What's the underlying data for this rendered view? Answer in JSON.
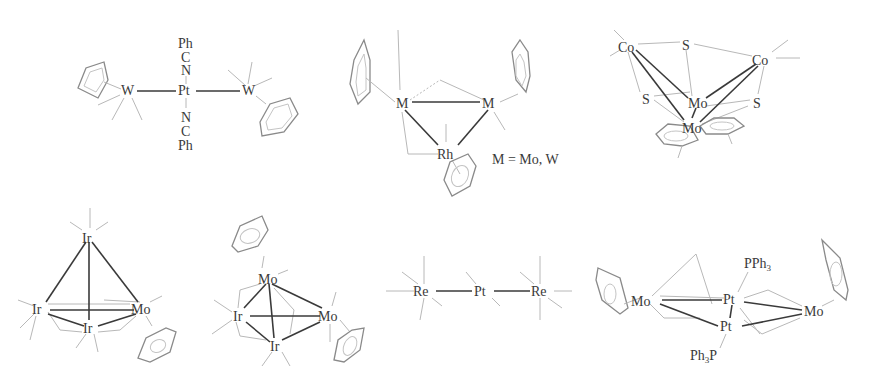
{
  "figure": {
    "colors": {
      "bond": "#3a3a3a",
      "ligand_line": "#b8b8b8",
      "ring": "#8a8a8a",
      "background": "#ffffff"
    },
    "structures": [
      {
        "id": "s1",
        "atoms": {
          "w_left": "W",
          "pt": "Pt",
          "w_right": "W",
          "ph_top": "Ph",
          "c_top": "C",
          "n_top": "N",
          "n_bottom": "N",
          "c_bottom": "C",
          "ph_bottom": "Ph"
        }
      },
      {
        "id": "s2",
        "atoms": {
          "m_left": "M",
          "m_right": "M",
          "rh": "Rh"
        },
        "legend": "M = Mo, W"
      },
      {
        "id": "s3",
        "atoms": {
          "co_left": "Co",
          "s_top": "S",
          "co_right": "Co",
          "mo_upper": "Mo",
          "s_left": "S",
          "s_right": "S",
          "mo_lower": "Mo"
        }
      },
      {
        "id": "s4",
        "atoms": {
          "ir_top": "Ir",
          "ir_left": "Ir",
          "mo": "Mo",
          "ir_bottom": "Ir"
        }
      },
      {
        "id": "s5",
        "atoms": {
          "mo_top": "Mo",
          "ir_left": "Ir",
          "mo_right": "Mo",
          "ir_bottom": "Ir"
        }
      },
      {
        "id": "s6",
        "atoms": {
          "re_left": "Re",
          "pt": "Pt",
          "re_right": "Re"
        }
      },
      {
        "id": "s7",
        "atoms": {
          "mo_left": "Mo",
          "pt_upper": "Pt",
          "mo_right": "Mo",
          "pt_lower": "Pt"
        },
        "ligands": {
          "pph3_top": {
            "main": "PPh",
            "sub": "3"
          },
          "ph3p_bottom": {
            "pre": "Ph",
            "sub": "3",
            "post": "P"
          }
        }
      }
    ]
  }
}
